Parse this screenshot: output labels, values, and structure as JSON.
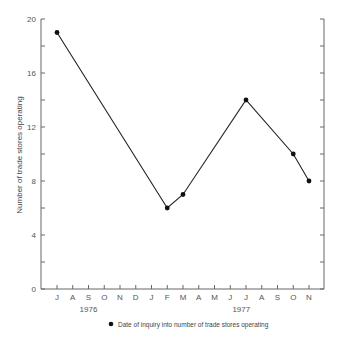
{
  "chart_data": {
    "type": "line",
    "title": "",
    "xlabel": "",
    "ylabel": "Number of trade stores operating",
    "ylim": [
      0,
      20
    ],
    "yticks": [
      0,
      4,
      8,
      12,
      16,
      20
    ],
    "yminor_ticks": [
      2,
      6,
      10,
      14,
      18
    ],
    "grid": false,
    "categories": [
      "J",
      "A",
      "S",
      "O",
      "N",
      "D",
      "J",
      "F",
      "M",
      "A",
      "M",
      "J",
      "J",
      "A",
      "S",
      "O",
      "N"
    ],
    "year_labels": [
      {
        "label": "1976",
        "under_index": 2
      },
      {
        "label": "1977",
        "under_index": 11.7
      }
    ],
    "series": [
      {
        "name": "Date of inquiry into number of trade stores operating",
        "marker": "filled-circle",
        "points": [
          {
            "index": 0,
            "month": "Jul 1976",
            "value": 19
          },
          {
            "index": 7,
            "month": "Feb 1977",
            "value": 6
          },
          {
            "index": 8,
            "month": "Mar 1977",
            "value": 7
          },
          {
            "index": 12,
            "month": "Jul 1977",
            "value": 14
          },
          {
            "index": 15,
            "month": "Oct 1977",
            "value": 10
          },
          {
            "index": 16,
            "month": "Nov 1977",
            "value": 8
          }
        ]
      }
    ],
    "legend": {
      "position": "bottom",
      "text": "Date of inquiry into number of trade stores operating"
    },
    "colors": {
      "line": "#222222",
      "axis": "#666666",
      "marker": "#111111"
    }
  }
}
